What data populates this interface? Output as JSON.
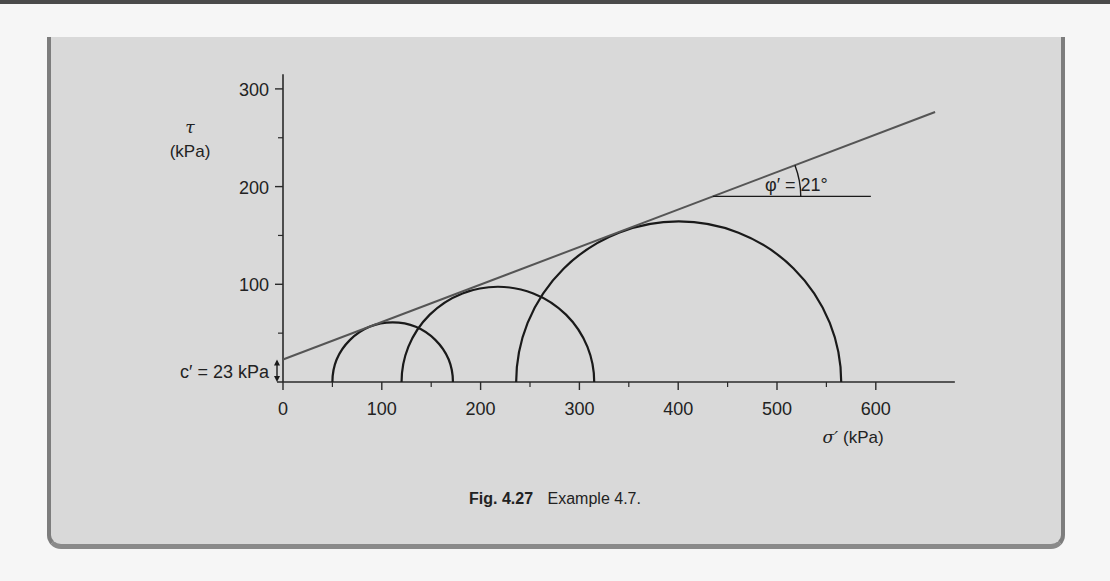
{
  "caption": {
    "figure_number": "Fig. 4.27",
    "text": "Example 4.7."
  },
  "colors": {
    "panel": "#d9d9d9",
    "panel_border": "#7d7d7d",
    "ink": "#1a1a1a",
    "envelope_line": "#555555"
  },
  "chart_data": {
    "type": "line",
    "xlabel_symbol": "σ′",
    "xlabel_unit": "(kPa)",
    "ylabel_symbol": "τ",
    "ylabel_unit": "(kPa)",
    "xlim": [
      0,
      680
    ],
    "ylim": [
      0,
      315
    ],
    "x_ticks": [
      0,
      100,
      200,
      300,
      400,
      500,
      600
    ],
    "x_tick_labels": [
      "0",
      "100",
      "200",
      "300",
      "400",
      "500",
      "600"
    ],
    "x_minor_ticks": [
      50,
      150,
      250,
      350,
      450,
      550
    ],
    "y_ticks": [
      100,
      200,
      300
    ],
    "y_tick_labels": [
      "100",
      "200",
      "300"
    ],
    "y_minor_ticks": [
      50,
      150,
      250
    ],
    "grid": false,
    "circles": [
      {
        "name": "circle-1",
        "sigma3": 50,
        "sigma1": 172
      },
      {
        "name": "circle-2",
        "sigma3": 120,
        "sigma1": 315
      },
      {
        "name": "circle-3",
        "sigma3": 236,
        "sigma1": 565
      }
    ],
    "envelope": {
      "cohesion_kpa": 23,
      "friction_angle_deg": 21,
      "x_range": [
        0,
        660
      ]
    },
    "annotations": {
      "cohesion_label": "c′ = 23 kPa",
      "angle_label": "φ′ = 21°",
      "angle_marker_x_range": [
        435,
        595
      ]
    }
  }
}
